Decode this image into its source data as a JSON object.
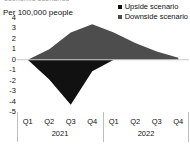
{
  "clipped_heading": "economic scenarios",
  "axis_unit_label": "Per 100,000 people",
  "legend": {
    "items": [
      {
        "label": "Upside scenario",
        "color": "#111111",
        "marker": "square-marker"
      },
      {
        "label": "Downside scenario",
        "color": "#4d4d4d",
        "marker": "square-marker"
      }
    ]
  },
  "chart_data": {
    "type": "area",
    "title": "",
    "subtitle": "",
    "xlabel": "",
    "ylabel": "Per 100,000 people",
    "ylim": [
      -5,
      4
    ],
    "yticks": [
      4,
      3,
      2,
      1,
      0,
      -1,
      -2,
      -3,
      -4,
      -5
    ],
    "grid": false,
    "zero_line": 0,
    "legend_position": "top-right",
    "categories": [
      "Q1 2021",
      "Q2 2021",
      "Q3 2021",
      "Q4 2021",
      "Q1 2022",
      "Q2 2022",
      "Q3 2022",
      "Q4 2022"
    ],
    "x": [
      "Q1",
      "Q2",
      "Q3",
      "Q4",
      "Q1",
      "Q2",
      "Q3",
      "Q4"
    ],
    "year_groups": [
      {
        "label": "2021",
        "quarters": [
          "Q1",
          "Q2",
          "Q3",
          "Q4"
        ]
      },
      {
        "label": "2022",
        "quarters": [
          "Q1",
          "Q2",
          "Q3",
          "Q4"
        ]
      }
    ],
    "series": [
      {
        "name": "Upside scenario",
        "color": "#111111",
        "values": [
          0.0,
          -1.9,
          -4.3,
          -1.1,
          0.0,
          0.0,
          0.0,
          0.0
        ]
      },
      {
        "name": "Downside scenario",
        "color": "#4d4d4d",
        "values": [
          0.0,
          1.0,
          2.6,
          3.4,
          2.6,
          1.6,
          0.8,
          0.2
        ]
      }
    ]
  }
}
